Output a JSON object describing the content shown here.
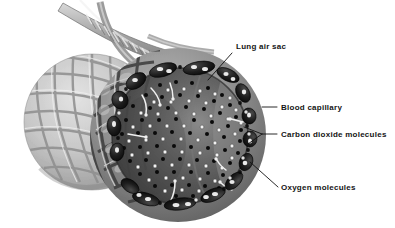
{
  "figure": {
    "kind": "anatomical-illustration",
    "background_color": "#ffffff",
    "rendering": "grayscale halftone airbrush illustration"
  },
  "labels": [
    {
      "id": "lung-air-sac",
      "text": "Lung air sac",
      "text_x": 236,
      "text_y": 49,
      "leader": "M232,53 L208,80",
      "points_to": "interior cavity of the cut-open alveolus"
    },
    {
      "id": "blood-capillary",
      "text": "Blood capillary",
      "text_x": 281,
      "text_y": 110,
      "leader": "M277,107 L262,107",
      "points_to": "dark vessel ring on the outer rim of the alveolus"
    },
    {
      "id": "carbon-dioxide-molecules",
      "text": "Carbon dioxide molecules",
      "text_x": 281,
      "text_y": 137,
      "leader": "M277,134 L262,134 M262,134 L244,127 M262,134 L248,144",
      "points_to": "black dots inside the air sac and in the capillaries"
    },
    {
      "id": "oxygen-molecules",
      "text": "Oxygen molecules",
      "text_x": 281,
      "text_y": 190,
      "leader": "M278,187 L250,162",
      "points_to": "white dots inside the air sac and in the capillaries"
    }
  ],
  "molecules": {
    "carbon_dioxide": {
      "color": "#0a0a0a",
      "shape": "filled-circle",
      "radius_px": 2.0
    },
    "oxygen": {
      "color": "#f2f2f2",
      "shape": "filled-circle",
      "radius_px": 1.9,
      "outline": "#2a2a2a"
    }
  },
  "structures": [
    {
      "name": "bronchiole-branch",
      "description": "branching airway tubes entering from the top-left"
    },
    {
      "name": "rear-air-sac",
      "description": "second whole alveolus behind, covered with a light capillary mesh"
    },
    {
      "name": "front-air-sac-cutaway",
      "description": "front alveolus cut open revealing the dark interior cavity"
    },
    {
      "name": "capillary-ring",
      "description": "dark blood capillaries encircling the cut rim of the front air sac"
    },
    {
      "name": "diffusion-arrows",
      "description": "small white curved arrows showing gas diffusion across the wall"
    }
  ],
  "palette": {
    "background": "#ffffff",
    "ink": "#141414",
    "mesh_light": "#cfcfcf",
    "mesh_mid": "#9a9a9a",
    "mesh_dark": "#6d6d6d",
    "cavity_dark": "#3a3a3a",
    "cavity_mid": "#565656",
    "cavity_light": "#7c7c7c",
    "vessel_black": "#161616"
  }
}
